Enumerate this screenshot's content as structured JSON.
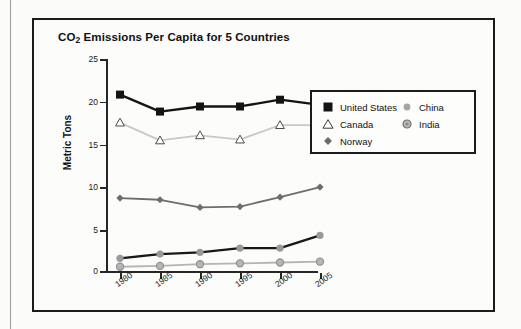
{
  "chart_data": {
    "type": "line",
    "title": "CO2 Emissions Per Capita for 5 Countries",
    "title_prefix": "CO",
    "title_sub": "2",
    "title_rest": " Emissions Per Capita for 5 Countries",
    "xlabel": "",
    "ylabel": "Metric Tons",
    "categories": [
      "1980",
      "1985",
      "1990",
      "1995",
      "2000",
      "2005"
    ],
    "x": [
      1980,
      1985,
      1990,
      1995,
      2000,
      2005
    ],
    "ylim": [
      0,
      25
    ],
    "yticks": [
      0,
      5,
      10,
      15,
      20,
      25
    ],
    "grid": false,
    "legend_position": "right",
    "series": [
      {
        "name": "United States",
        "marker": "filled-square",
        "color": "#141414",
        "line_color": "#141414",
        "values": [
          20.8,
          18.8,
          19.4,
          19.4,
          20.2,
          19.6
        ]
      },
      {
        "name": "Canada",
        "marker": "open-triangle",
        "color": "#ffffff",
        "line_color": "#c8c8c8",
        "values": [
          17.5,
          15.4,
          16.0,
          15.5,
          17.2,
          17.2
        ]
      },
      {
        "name": "Norway",
        "marker": "filled-diamond",
        "color": "#6d6d6d",
        "line_color": "#6d6d6d",
        "values": [
          8.6,
          8.4,
          7.5,
          7.6,
          8.7,
          9.9
        ]
      },
      {
        "name": "China",
        "marker": "filled-circle-small",
        "color": "#9a9a9a",
        "line_color": "#181818",
        "values": [
          1.5,
          2.0,
          2.2,
          2.7,
          2.7,
          4.2
        ]
      },
      {
        "name": "India",
        "marker": "ringed-circle",
        "color": "#a0a0a0",
        "line_color": "#b4b4b4",
        "values": [
          0.5,
          0.6,
          0.8,
          0.9,
          1.0,
          1.1
        ]
      }
    ]
  },
  "legend": {
    "left_entries": [
      "United States",
      "Canada",
      "Norway"
    ],
    "right_entries": [
      "China",
      "India"
    ]
  },
  "axis": {
    "y_tick_labels": [
      "25",
      "20",
      "15",
      "10",
      "5",
      "0"
    ],
    "x_tick_labels": [
      "1980",
      "1985",
      "1990",
      "1995",
      "2000",
      "2005"
    ],
    "y_axis_title": "Metric Tons"
  }
}
